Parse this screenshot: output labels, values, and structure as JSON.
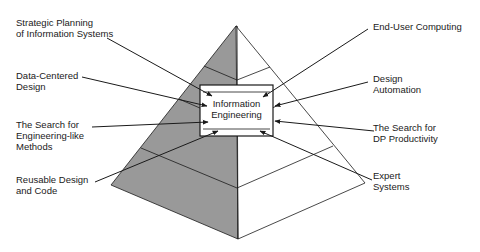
{
  "diagram": {
    "center": {
      "line1": "Information",
      "line2": "Engineering"
    },
    "left_labels": [
      {
        "line1": "Strategic Planning",
        "line2": "of Information Systems"
      },
      {
        "line1": "Data-Centered",
        "line2": "Design"
      },
      {
        "line1": "The Search for",
        "line2": "Engineering-like",
        "line3": "Methods"
      },
      {
        "line1": "Reusable Design",
        "line2": "and Code"
      }
    ],
    "right_labels": [
      {
        "line1": "End-User Computing"
      },
      {
        "line1": "Design",
        "line2": "Automation"
      },
      {
        "line1": "The Search for",
        "line2": "DP Productivity"
      },
      {
        "line1": "Expert",
        "line2": "Systems"
      }
    ],
    "colors": {
      "shaded_face": "#999999",
      "line": "#1a1a1a",
      "background": "#ffffff"
    }
  }
}
